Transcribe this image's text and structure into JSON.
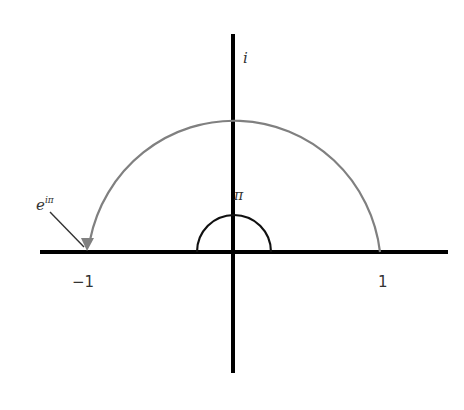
{
  "diagram": {
    "labels": {
      "imaginary_axis": "i",
      "angle": "π",
      "euler_base": "e",
      "euler_exponent": "iπ",
      "minus_one": "−1",
      "one": "1"
    },
    "colors": {
      "axes": "#000000",
      "arc": "#808080",
      "angle_arc": "#111111",
      "text": "#333333"
    },
    "geometry": {
      "origin": [
        233,
        252
      ],
      "unit_radius": 146,
      "angle_radius": 37
    }
  }
}
